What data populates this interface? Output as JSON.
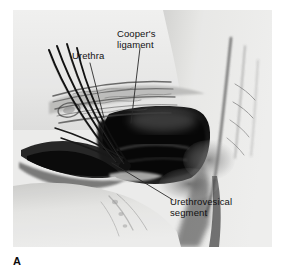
{
  "figure": {
    "letter": "A",
    "plate_background": "#f2f2f1",
    "page_background": "#ffffff",
    "ink_color": "#111111",
    "leader_color": "#2a2a2a"
  },
  "annotations": [
    {
      "id": "urethra",
      "text": "Urethra",
      "leader": {
        "x1": 90,
        "y1": 63,
        "x2": 104,
        "y2": 118
      }
    },
    {
      "id": "coopers-ligament",
      "text": "Cooper's\nligament",
      "leader": {
        "x1": 140,
        "y1": 48,
        "x2": 131,
        "y2": 123
      }
    },
    {
      "id": "urethrovesical-segment",
      "text": "Urethrovesical\nsegment",
      "leader": {
        "x1": 112,
        "y1": 163,
        "x2": 173,
        "y2": 200
      }
    }
  ]
}
